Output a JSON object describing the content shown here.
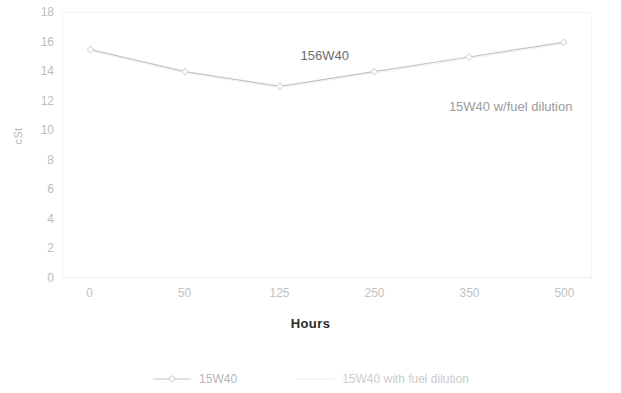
{
  "chart_data": {
    "type": "line",
    "title": "",
    "xlabel": "Hours",
    "ylabel": "cSt",
    "categories": [
      "0",
      "50",
      "125",
      "250",
      "350",
      "500"
    ],
    "xlim": [
      0,
      5
    ],
    "ylim": [
      0,
      18
    ],
    "y_ticks": [
      "0",
      "2",
      "4",
      "6",
      "8",
      "10",
      "12",
      "14",
      "16",
      "18"
    ],
    "grid": false,
    "legend_position": "bottom",
    "series": [
      {
        "name": "15W40",
        "color": "#c3c3c3",
        "marker": "diamond",
        "values": [
          15.5,
          14.0,
          13.0,
          14.0,
          15.0,
          16.0
        ]
      },
      {
        "name": "15W40 with fuel dilution",
        "color": "#f0f0f0",
        "marker": "none",
        "values": [
          15.4,
          13.9,
          12.9,
          13.9,
          14.9,
          15.9
        ]
      }
    ],
    "annotations": [
      {
        "text": "156W40",
        "x_frac": 0.45,
        "y_value": 15.0
      },
      {
        "text": "15W40 w/fuel dilution",
        "x_frac": 0.73,
        "y_value": 11.6
      }
    ],
    "legend": [
      {
        "label": "15W40",
        "color": "#c3c3c3",
        "marker": "diamond"
      },
      {
        "label": "15W40 with fuel dilution",
        "color": "#ececec",
        "marker": "none"
      }
    ]
  }
}
